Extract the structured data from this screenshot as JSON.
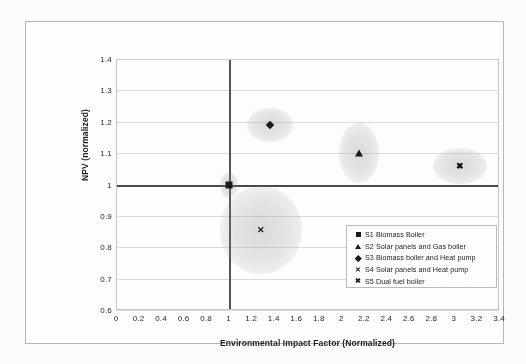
{
  "chart_data": {
    "type": "scatter",
    "title": "",
    "xlabel": "Environmental Impact Factor (Normalized)",
    "ylabel": "NPV (normalized)",
    "xlim": [
      0,
      3.4
    ],
    "ylim": [
      0.6,
      1.4
    ],
    "xticks": [
      "0",
      "0.2",
      "0.4",
      "0.6",
      "0.8",
      "1",
      "1.2",
      "1.4",
      "1.6",
      "1.8",
      "2",
      "2.2",
      "2.4",
      "2.6",
      "2.8",
      "3",
      "3.2",
      "3.4"
    ],
    "yticks": [
      "1.4",
      "1.3",
      "1.2",
      "1.1",
      "1",
      "0.9",
      "0.8",
      "0.7",
      "0.6"
    ],
    "grid": true,
    "reference_lines": {
      "x": 1,
      "y": 1
    },
    "legend_position": "center-right",
    "series": [
      {
        "name": "S1 Biomass Boiler",
        "marker": "square",
        "x": 1.0,
        "y": 1.0,
        "bubble_rx": 9,
        "bubble_ry": 13
      },
      {
        "name": "S2 Solar panels and Gas boiler",
        "marker": "triangle",
        "x": 2.16,
        "y": 1.1,
        "bubble_rx": 20,
        "bubble_ry": 30
      },
      {
        "name": "S3 Biomass boiler and Heat pump",
        "marker": "diamond",
        "x": 1.37,
        "y": 1.19,
        "bubble_rx": 23,
        "bubble_ry": 17
      },
      {
        "name": "S4 Solar panels and Heat pump",
        "marker": "x",
        "x": 1.29,
        "y": 0.855,
        "bubble_rx": 41,
        "bubble_ry": 44
      },
      {
        "name": "S5 Dual fuel boiler",
        "marker": "x-bold",
        "x": 3.05,
        "y": 1.06,
        "bubble_rx": 27,
        "bubble_ry": 18
      }
    ],
    "legend": [
      {
        "symbol": "square",
        "label": "S1 Biomass Boiler"
      },
      {
        "symbol": "triangle",
        "label": "S2 Solar panels and Gas boiler"
      },
      {
        "symbol": "diamond",
        "label": "S3 Biomass boiler and Heat pump"
      },
      {
        "symbol": "x",
        "label": "S4 Solar panels and Heat pump"
      },
      {
        "symbol": "x-bold",
        "label": "S5 Dual fuel boiler"
      }
    ]
  }
}
